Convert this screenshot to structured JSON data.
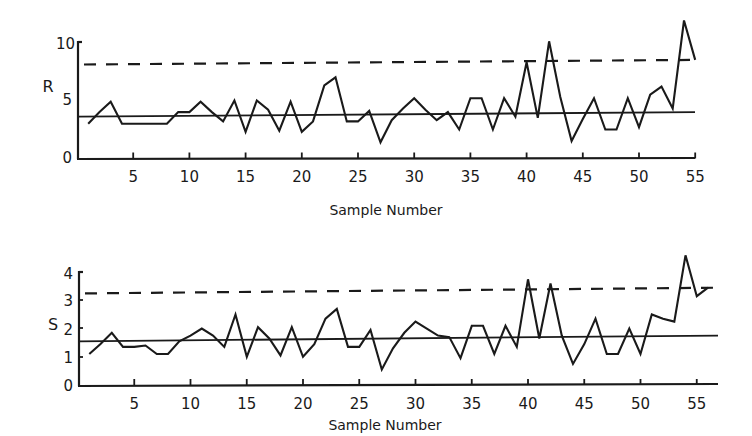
{
  "chart_data": [
    {
      "type": "line",
      "title": "",
      "ylabel": "R",
      "xlabel": "Sample Number",
      "xlim": [
        0,
        56
      ],
      "ylim": [
        0,
        10
      ],
      "xticks": [
        5,
        10,
        15,
        20,
        25,
        30,
        35,
        40,
        45,
        50,
        55
      ],
      "yticks": [
        0,
        5,
        10
      ],
      "grid": false,
      "legend": null,
      "x": [
        1,
        2,
        3,
        4,
        5,
        6,
        7,
        8,
        9,
        10,
        11,
        12,
        13,
        14,
        15,
        16,
        17,
        18,
        19,
        20,
        21,
        22,
        23,
        24,
        25,
        26,
        27,
        28,
        29,
        30,
        31,
        32,
        33,
        34,
        35,
        36,
        37,
        38,
        39,
        40,
        41,
        42,
        43,
        44,
        45,
        46,
        47,
        48,
        49,
        50,
        51,
        52,
        53,
        54,
        55
      ],
      "series": [
        {
          "name": "R",
          "style": "solid-jagged",
          "values": [
            3.0,
            4.0,
            4.9,
            3.0,
            3.0,
            3.0,
            3.0,
            3.0,
            4.0,
            4.0,
            4.9,
            4.0,
            3.2,
            5.0,
            2.3,
            5.0,
            4.2,
            2.4,
            4.9,
            2.3,
            3.2,
            6.3,
            7.0,
            3.2,
            3.2,
            4.1,
            1.4,
            3.3,
            4.3,
            5.2,
            4.2,
            3.3,
            4.0,
            2.5,
            5.2,
            5.2,
            2.5,
            5.2,
            3.6,
            8.3,
            3.5,
            10.1,
            5.3,
            1.5,
            3.4,
            5.2,
            2.5,
            2.5,
            5.2,
            2.7,
            5.5,
            6.2,
            4.3,
            11.9,
            8.5
          ]
        },
        {
          "name": "Center line (R-bar)",
          "style": "solid",
          "values_at_ends": [
            3.6,
            4.0
          ]
        },
        {
          "name": "Upper control limit",
          "style": "dashed",
          "values_at_ends": [
            8.1,
            8.5
          ]
        }
      ]
    },
    {
      "type": "line",
      "title": "",
      "ylabel": "S",
      "xlabel": "Sample Number",
      "xlim": [
        0,
        56
      ],
      "ylim": [
        0,
        4
      ],
      "xticks": [
        5,
        10,
        15,
        20,
        25,
        30,
        35,
        40,
        45,
        50,
        55
      ],
      "yticks": [
        0,
        1,
        2,
        3,
        4
      ],
      "grid": false,
      "legend": null,
      "x": [
        1,
        2,
        3,
        4,
        5,
        6,
        7,
        8,
        9,
        10,
        11,
        12,
        13,
        14,
        15,
        16,
        17,
        18,
        19,
        20,
        21,
        22,
        23,
        24,
        25,
        26,
        27,
        28,
        29,
        30,
        31,
        32,
        33,
        34,
        35,
        36,
        37,
        38,
        39,
        40,
        41,
        42,
        43,
        44,
        45,
        46,
        47,
        48,
        49,
        50,
        51,
        52,
        53,
        54,
        55,
        56
      ],
      "series": [
        {
          "name": "S",
          "style": "solid-jagged",
          "values": [
            1.1,
            1.45,
            1.85,
            1.35,
            1.35,
            1.4,
            1.1,
            1.1,
            1.55,
            1.75,
            2.0,
            1.75,
            1.35,
            2.5,
            1.0,
            2.05,
            1.65,
            1.05,
            2.05,
            1.0,
            1.45,
            2.35,
            2.7,
            1.35,
            1.35,
            1.95,
            0.55,
            1.3,
            1.85,
            2.25,
            2.0,
            1.75,
            1.7,
            0.95,
            2.1,
            2.1,
            1.1,
            2.1,
            1.35,
            3.75,
            1.65,
            3.6,
            1.75,
            0.75,
            1.45,
            2.35,
            1.1,
            1.1,
            2.0,
            1.1,
            2.5,
            2.35,
            2.25,
            4.6,
            3.15,
            3.45
          ]
        },
        {
          "name": "Center line (S-bar)",
          "style": "solid",
          "values_at_ends": [
            1.55,
            1.75
          ]
        },
        {
          "name": "Upper control limit",
          "style": "dashed",
          "values_at_ends": [
            3.25,
            3.45
          ]
        }
      ]
    }
  ],
  "panels": {
    "r": {
      "ylabel": "R",
      "xlabel": "Sample Number",
      "ytick_labels": [
        "0",
        "5",
        "10"
      ],
      "xtick_labels": [
        "5",
        "10",
        "15",
        "20",
        "25",
        "30",
        "35",
        "40",
        "45",
        "50",
        "55"
      ]
    },
    "s": {
      "ylabel": "S",
      "xlabel": "Sample Number",
      "ytick_labels": [
        "0",
        "1",
        "2",
        "3",
        "4"
      ],
      "xtick_labels": [
        "5",
        "10",
        "15",
        "20",
        "25",
        "30",
        "35",
        "40",
        "45",
        "50",
        "55"
      ]
    }
  },
  "colors": {
    "ink": "#1a1a1a",
    "background": "#ffffff"
  }
}
